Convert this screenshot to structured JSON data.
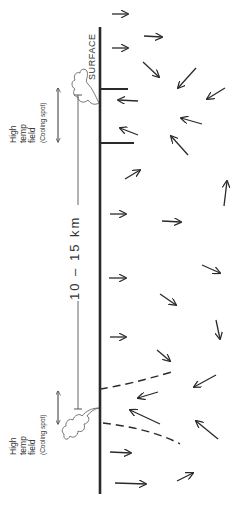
{
  "diagram": {
    "colors": {
      "ink": "#2a2a2a",
      "background": "#ffffff"
    },
    "labels": {
      "surface": "SURFACE",
      "distance": "10 – 15  km",
      "top_field": {
        "line1": "High",
        "line2": "temp",
        "line3": "field",
        "note": "(Cooling spot)"
      },
      "bottom_field": {
        "line1": "High",
        "line2": "temp",
        "line3": "field",
        "note": "(Cooling spot)"
      }
    },
    "surface_line": {
      "x": 100,
      "y_top": 27,
      "y_bottom": 494
    },
    "tick_marks": [
      {
        "y": 89,
        "length": 28
      },
      {
        "y": 143,
        "length": 34
      },
      {
        "y": 388,
        "length": 0,
        "dashed_curve": true
      }
    ],
    "arrows": [
      {
        "x1": 112,
        "y1": 14,
        "x2": 128,
        "y2": 14
      },
      {
        "x1": 144,
        "y1": 36,
        "x2": 162,
        "y2": 37
      },
      {
        "x1": 112,
        "y1": 48,
        "x2": 128,
        "y2": 48
      },
      {
        "x1": 143,
        "y1": 62,
        "x2": 159,
        "y2": 77
      },
      {
        "x1": 196,
        "y1": 68,
        "x2": 178,
        "y2": 88
      },
      {
        "x1": 225,
        "y1": 88,
        "x2": 207,
        "y2": 99
      },
      {
        "x1": 138,
        "y1": 101,
        "x2": 118,
        "y2": 100
      },
      {
        "x1": 202,
        "y1": 124,
        "x2": 181,
        "y2": 118
      },
      {
        "x1": 138,
        "y1": 135,
        "x2": 120,
        "y2": 128
      },
      {
        "x1": 188,
        "y1": 155,
        "x2": 171,
        "y2": 136
      },
      {
        "x1": 125,
        "y1": 179,
        "x2": 140,
        "y2": 170
      },
      {
        "x1": 224,
        "y1": 206,
        "x2": 227,
        "y2": 181
      },
      {
        "x1": 110,
        "y1": 214,
        "x2": 126,
        "y2": 214
      },
      {
        "x1": 162,
        "y1": 221,
        "x2": 181,
        "y2": 222
      },
      {
        "x1": 202,
        "y1": 265,
        "x2": 220,
        "y2": 273
      },
      {
        "x1": 109,
        "y1": 278,
        "x2": 126,
        "y2": 278
      },
      {
        "x1": 160,
        "y1": 294,
        "x2": 176,
        "y2": 305
      },
      {
        "x1": 216,
        "y1": 320,
        "x2": 220,
        "y2": 339
      },
      {
        "x1": 110,
        "y1": 337,
        "x2": 126,
        "y2": 337
      },
      {
        "x1": 157,
        "y1": 350,
        "x2": 170,
        "y2": 361
      },
      {
        "x1": 216,
        "y1": 375,
        "x2": 194,
        "y2": 387
      },
      {
        "x1": 158,
        "y1": 392,
        "x2": 138,
        "y2": 398
      },
      {
        "x1": 160,
        "y1": 424,
        "x2": 130,
        "y2": 410
      },
      {
        "x1": 218,
        "y1": 439,
        "x2": 196,
        "y2": 421
      },
      {
        "x1": 110,
        "y1": 452,
        "x2": 131,
        "y2": 453
      },
      {
        "x1": 177,
        "y1": 481,
        "x2": 193,
        "y2": 473
      },
      {
        "x1": 115,
        "y1": 483,
        "x2": 146,
        "y2": 484
      }
    ],
    "dashed_curves": [
      {
        "d": "M100,389 C120,386 145,380 175,371"
      },
      {
        "d": "M103,423 C130,426 160,433 180,444"
      }
    ],
    "distance_bar": {
      "x": 78,
      "y_top": 95,
      "y_bottom": 409
    },
    "double_arrows": [
      {
        "x": 58,
        "y_top": 86,
        "y_bottom": 143
      },
      {
        "x": 58,
        "y_top": 390,
        "y_bottom": 424
      }
    ]
  }
}
